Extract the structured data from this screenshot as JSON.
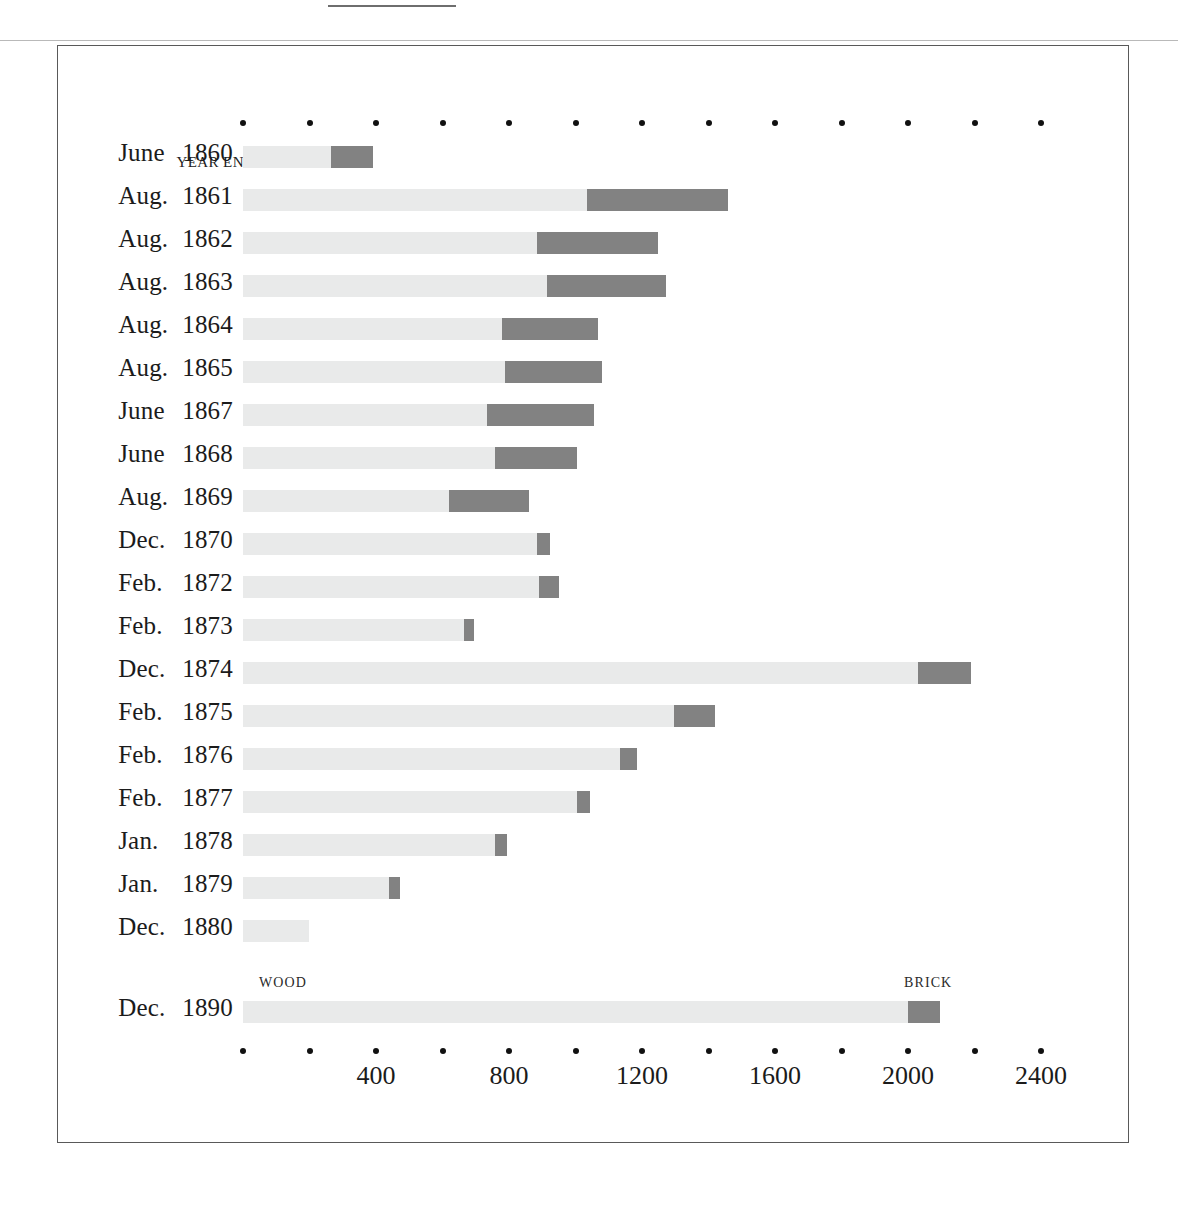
{
  "figure": {
    "row_header_label": "YEAR ENDING",
    "series_captions": [
      {
        "name": "wood",
        "label": "WOOD"
      },
      {
        "name": "brick",
        "label": "BRICK"
      }
    ]
  },
  "colors": {
    "wood": "#e9eaea",
    "brick": "#828282",
    "frame": "#595959",
    "text": "#1b1b1b",
    "tick_dot": "#111111"
  },
  "chart_data": {
    "type": "bar",
    "orientation": "horizontal",
    "stacked": true,
    "title": "",
    "xlabel": "",
    "ylabel": "YEAR ENDING",
    "xlim": [
      0,
      2400
    ],
    "grid": false,
    "legend_position": "inline-above-last-row",
    "xticks": [
      0,
      200,
      400,
      600,
      800,
      1000,
      1200,
      1400,
      1600,
      1800,
      2000,
      2200,
      2400
    ],
    "xticklabels": [
      "",
      "",
      "400",
      "",
      "800",
      "",
      "1200",
      "",
      "1600",
      "",
      "2000",
      "",
      "2400"
    ],
    "categories": [
      "June 1860",
      "Aug. 1861",
      "Aug. 1862",
      "Aug. 1863",
      "Aug. 1864",
      "Aug. 1865",
      "June 1867",
      "June 1868",
      "Aug. 1869",
      "Dec. 1870",
      "Feb. 1872",
      "Feb. 1873",
      "Dec. 1874",
      "Feb. 1875",
      "Feb. 1876",
      "Feb. 1877",
      "Jan. 1878",
      "Jan. 1879",
      "Dec. 1880",
      "Dec. 1890"
    ],
    "series": [
      {
        "name": "WOOD",
        "color": "#e9eaea",
        "values": [
          265,
          1035,
          885,
          915,
          780,
          787,
          733,
          757,
          621,
          884,
          890,
          664,
          2030,
          1297,
          1134,
          1005,
          757,
          438,
          199,
          2000
        ]
      },
      {
        "name": "BRICK",
        "color": "#828282",
        "values": [
          127,
          423,
          362,
          356,
          287,
          293,
          323,
          247,
          239,
          39,
          60,
          30,
          160,
          124,
          51,
          39,
          36,
          33,
          0,
          97
        ]
      }
    ],
    "rows": [
      {
        "category": "June 1860",
        "month": "June",
        "year": "1860",
        "wood": 265,
        "brick": 127,
        "total": 392
      },
      {
        "category": "Aug. 1861",
        "month": "Aug.",
        "year": "1861",
        "wood": 1035,
        "brick": 423,
        "total": 1458
      },
      {
        "category": "Aug. 1862",
        "month": "Aug.",
        "year": "1862",
        "wood": 885,
        "brick": 362,
        "total": 1247
      },
      {
        "category": "Aug. 1863",
        "month": "Aug.",
        "year": "1863",
        "wood": 915,
        "brick": 356,
        "total": 1271
      },
      {
        "category": "Aug. 1864",
        "month": "Aug.",
        "year": "1864",
        "wood": 780,
        "brick": 287,
        "total": 1067
      },
      {
        "category": "Aug. 1865",
        "month": "Aug.",
        "year": "1865",
        "wood": 787,
        "brick": 293,
        "total": 1080
      },
      {
        "category": "June 1867",
        "month": "June",
        "year": "1867",
        "wood": 733,
        "brick": 323,
        "total": 1056
      },
      {
        "category": "June 1868",
        "month": "June",
        "year": "1868",
        "wood": 757,
        "brick": 247,
        "total": 1004
      },
      {
        "category": "Aug. 1869",
        "month": "Aug.",
        "year": "1869",
        "wood": 621,
        "brick": 239,
        "total": 860
      },
      {
        "category": "Dec. 1870",
        "month": "Dec.",
        "year": "1870",
        "wood": 884,
        "brick": 39,
        "total": 923
      },
      {
        "category": "Feb. 1872",
        "month": "Feb.",
        "year": "1872",
        "wood": 890,
        "brick": 60,
        "total": 950
      },
      {
        "category": "Feb. 1873",
        "month": "Feb.",
        "year": "1873",
        "wood": 664,
        "brick": 30,
        "total": 694
      },
      {
        "category": "Dec. 1874",
        "month": "Dec.",
        "year": "1874",
        "wood": 2030,
        "brick": 160,
        "total": 2190
      },
      {
        "category": "Feb. 1875",
        "month": "Feb.",
        "year": "1875",
        "wood": 1297,
        "brick": 124,
        "total": 1421
      },
      {
        "category": "Feb. 1876",
        "month": "Feb.",
        "year": "1876",
        "wood": 1134,
        "brick": 51,
        "total": 1185
      },
      {
        "category": "Feb. 1877",
        "month": "Feb.",
        "year": "1877",
        "wood": 1005,
        "brick": 39,
        "total": 1044
      },
      {
        "category": "Jan.  1878",
        "month": "Jan.",
        "year": "1878",
        "wood": 757,
        "brick": 36,
        "total": 793
      },
      {
        "category": "Jan.  1879",
        "month": "Jan.",
        "year": "1879",
        "wood": 438,
        "brick": 33,
        "total": 471
      },
      {
        "category": "Dec. 1880",
        "month": "Dec.",
        "year": "1880",
        "wood": 199,
        "brick": 0,
        "total": 199
      },
      {
        "category": "Dec. 1890",
        "month": "Dec.",
        "year": "1890",
        "wood": 2000,
        "brick": 97,
        "total": 2097
      }
    ]
  }
}
